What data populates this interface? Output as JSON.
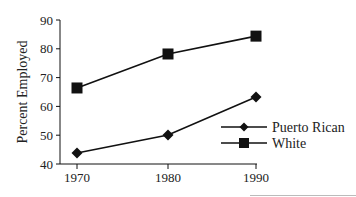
{
  "chart_data": {
    "type": "line",
    "title": "",
    "xlabel": "",
    "ylabel": "Percent Employed",
    "categories": [
      "1970",
      "1980",
      "1990"
    ],
    "x": [
      1970,
      1980,
      1990
    ],
    "ylim": [
      40,
      90
    ],
    "yticks": [
      40,
      50,
      60,
      70,
      80,
      90
    ],
    "xticks": [
      "1970",
      "1980",
      "1990"
    ],
    "grid": false,
    "legend_position": "lower right",
    "series": [
      {
        "name": "Puerto Rican",
        "marker": "diamond",
        "values": [
          43.8,
          50.1,
          63.3
        ],
        "color": "#111111"
      },
      {
        "name": "White",
        "marker": "square",
        "values": [
          66.4,
          78.2,
          84.4
        ],
        "color": "#111111"
      }
    ]
  },
  "legend": {
    "items": [
      {
        "label": "Puerto Rican"
      },
      {
        "label": "White"
      }
    ]
  }
}
